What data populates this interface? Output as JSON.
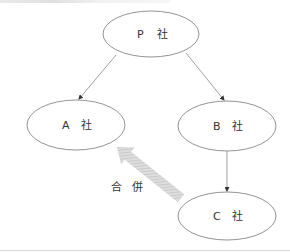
{
  "diagram": {
    "type": "corporate-structure",
    "nodes": [
      {
        "id": "P",
        "letter": "P",
        "suffix": "社",
        "cx": 151,
        "cy": 34,
        "rx": 48,
        "ry": 23
      },
      {
        "id": "A",
        "letter": "A",
        "suffix": "社",
        "cx": 76,
        "cy": 125,
        "rx": 49,
        "ry": 25
      },
      {
        "id": "B",
        "letter": "B",
        "suffix": "社",
        "cx": 227,
        "cy": 126,
        "rx": 49,
        "ry": 25
      },
      {
        "id": "C",
        "letter": "C",
        "suffix": "社",
        "cx": 227,
        "cy": 216,
        "rx": 49,
        "ry": 24
      }
    ],
    "edges": [
      {
        "from": "P",
        "to": "A",
        "style": "thin-arrow"
      },
      {
        "from": "P",
        "to": "B",
        "style": "thin-arrow"
      },
      {
        "from": "B",
        "to": "C",
        "style": "thin-arrow"
      },
      {
        "from": "C",
        "to": "A",
        "style": "wide-hatched-arrow",
        "label": "合　併"
      }
    ],
    "merge_label": {
      "char1": "合",
      "char2": "併"
    },
    "colors": {
      "stroke": "#777777",
      "text": "#333333",
      "merge_arrow": "#c8c8c8",
      "rule": "#d9d9d9"
    }
  }
}
